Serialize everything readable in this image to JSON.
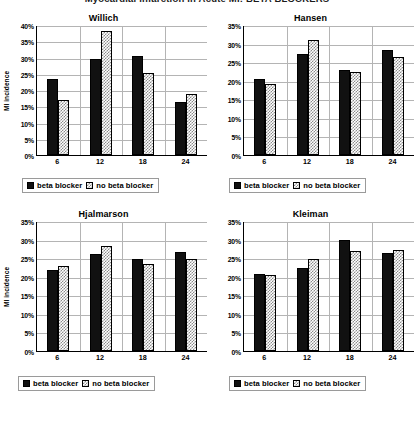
{
  "page": {
    "title": "Myocardial infarction in Acute MI: BETA BLOCKERS"
  },
  "legend": {
    "series": [
      {
        "key": "beta_blocker",
        "label": "beta blocker",
        "fill": "solid",
        "color": "#111111"
      },
      {
        "key": "no_beta_blocker",
        "label": "no beta blocker",
        "fill": "hatch",
        "color": "#8c8c8c"
      }
    ]
  },
  "axis": {
    "ylabel": "MI incidence"
  },
  "chart_data": [
    {
      "type": "bar",
      "title": "Willich",
      "xlabel": "",
      "ylabel": "MI incidence",
      "categories": [
        "6",
        "12",
        "18",
        "24"
      ],
      "ylim": [
        0,
        40
      ],
      "yticks": [
        "0%",
        "5%",
        "10%",
        "15%",
        "20%",
        "25%",
        "30%",
        "35%",
        "40%"
      ],
      "ytick_values": [
        0,
        5,
        10,
        15,
        20,
        25,
        30,
        35,
        40
      ],
      "grid": true,
      "legend_position": "bottom",
      "series": [
        {
          "name": "beta blocker",
          "values": [
            23.3,
            29.5,
            30.6,
            16.4
          ]
        },
        {
          "name": "no beta blocker",
          "values": [
            17.0,
            38.2,
            25.3,
            18.9
          ]
        }
      ]
    },
    {
      "type": "bar",
      "title": "Hansen",
      "xlabel": "",
      "ylabel": "",
      "categories": [
        "6",
        "12",
        "18",
        "24"
      ],
      "ylim": [
        0,
        35
      ],
      "yticks": [
        "0%",
        "5%",
        "10%",
        "15%",
        "20%",
        "25%",
        "30%",
        "35%"
      ],
      "ytick_values": [
        0,
        5,
        10,
        15,
        20,
        25,
        30,
        35
      ],
      "grid": true,
      "legend_position": "bottom",
      "series": [
        {
          "name": "beta blocker",
          "values": [
            20.6,
            27.2,
            23.0,
            28.3
          ]
        },
        {
          "name": "no beta blocker",
          "values": [
            19.1,
            31.1,
            22.4,
            26.4
          ]
        }
      ]
    },
    {
      "type": "bar",
      "title": "Hjalmarson",
      "xlabel": "",
      "ylabel": "MI incidence",
      "categories": [
        "6",
        "12",
        "18",
        "24"
      ],
      "ylim": [
        0,
        35
      ],
      "yticks": [
        "0%",
        "5%",
        "10%",
        "15%",
        "20%",
        "25%",
        "30%",
        "35%"
      ],
      "ytick_values": [
        0,
        5,
        10,
        15,
        20,
        25,
        30,
        35
      ],
      "grid": true,
      "legend_position": "bottom",
      "series": [
        {
          "name": "beta blocker",
          "values": [
            21.7,
            26.1,
            24.8,
            26.7
          ]
        },
        {
          "name": "no beta blocker",
          "values": [
            23.0,
            28.2,
            23.5,
            24.7
          ]
        }
      ]
    },
    {
      "type": "bar",
      "title": "Kleiman",
      "xlabel": "",
      "ylabel": "",
      "categories": [
        "6",
        "12",
        "18",
        "24"
      ],
      "ylim": [
        0,
        35
      ],
      "yticks": [
        "0%",
        "5%",
        "10%",
        "15%",
        "20%",
        "25%",
        "30%",
        "35%"
      ],
      "ytick_values": [
        0,
        5,
        10,
        15,
        20,
        25,
        30,
        35
      ],
      "grid": true,
      "legend_position": "bottom",
      "series": [
        {
          "name": "beta blocker",
          "values": [
            20.8,
            22.3,
            30.0,
            26.5
          ]
        },
        {
          "name": "no beta blocker",
          "values": [
            20.5,
            24.7,
            27.0,
            27.3
          ]
        }
      ]
    }
  ]
}
